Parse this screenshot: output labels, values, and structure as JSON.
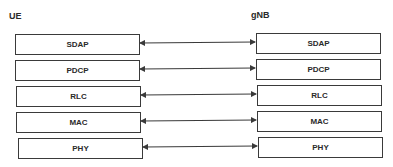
{
  "diagram": {
    "left_node": {
      "label": "UE"
    },
    "right_node": {
      "label": "gNB"
    },
    "layers": [
      {
        "name": "SDAP"
      },
      {
        "name": "PDCP"
      },
      {
        "name": "RLC"
      },
      {
        "name": "MAC"
      },
      {
        "name": "PHY"
      }
    ],
    "connections": [
      {
        "from": "UE.SDAP",
        "to": "gNB.SDAP",
        "type": "bidirectional-arrow"
      },
      {
        "from": "UE.PDCP",
        "to": "gNB.PDCP",
        "type": "bidirectional-arrow"
      },
      {
        "from": "UE.RLC",
        "to": "gNB.RLC",
        "type": "bidirectional-arrow"
      },
      {
        "from": "UE.MAC",
        "to": "gNB.MAC",
        "type": "bidirectional-arrow"
      },
      {
        "from": "UE.PHY",
        "to": "gNB.PHY",
        "type": "bidirectional-arrow"
      }
    ],
    "colors": {
      "line": "#3a3a3a",
      "text": "#2a2a2a",
      "background": "#ffffff"
    }
  }
}
